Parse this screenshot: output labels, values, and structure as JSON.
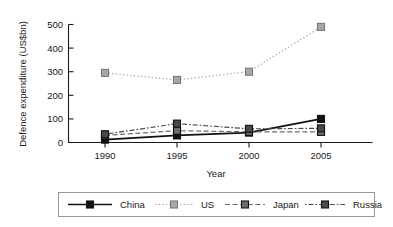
{
  "chart_data": {
    "type": "line",
    "title": "",
    "xlabel": "Year",
    "ylabel": "Defence expenditure (US$bn)",
    "x": [
      1990,
      1995,
      2000,
      2005
    ],
    "categories": [
      "1990",
      "1995",
      "2000",
      "2005"
    ],
    "xticklabels": [
      "1990",
      "1995",
      "2000",
      "2005"
    ],
    "yticklabels": [
      "0",
      "100",
      "200",
      "300",
      "400",
      "500"
    ],
    "yticks": [
      0,
      100,
      200,
      300,
      400,
      500
    ],
    "xlim": [
      1988,
      2007
    ],
    "ylim": [
      0,
      500
    ],
    "grid": false,
    "legend_position": "bottom",
    "series": [
      {
        "name": "China",
        "values": [
          12,
          30,
          42,
          100
        ],
        "color": "#111111",
        "linestyle": "solid",
        "marker": "square"
      },
      {
        "name": "US",
        "values": [
          295,
          265,
          300,
          490
        ],
        "color": "#a8a8a8",
        "linestyle": "dotted",
        "marker": "square"
      },
      {
        "name": "Japan",
        "values": [
          30,
          50,
          45,
          45
        ],
        "color": "#6e6e6e",
        "linestyle": "dashed",
        "marker": "square"
      },
      {
        "name": "Russia",
        "values": [
          35,
          80,
          58,
          60
        ],
        "color": "#4a4a4a",
        "linestyle": "dashdot",
        "marker": "square"
      }
    ]
  },
  "legend": {
    "entries": [
      {
        "label": "China"
      },
      {
        "label": "US"
      },
      {
        "label": "Japan"
      },
      {
        "label": "Russia"
      }
    ]
  }
}
